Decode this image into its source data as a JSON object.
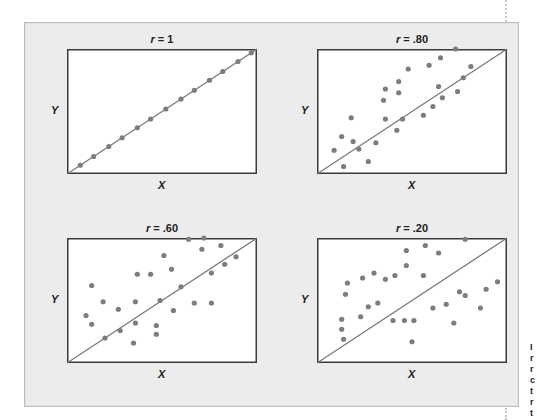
{
  "figure": {
    "side_text_fragment": [
      "I",
      "r",
      "r",
      "c",
      "t",
      "r",
      "t"
    ]
  },
  "chart_data": [
    {
      "type": "scatter",
      "title": "r = 1",
      "title_var": "r",
      "title_value": "= 1",
      "xlabel": "X",
      "ylabel": "Y",
      "grid": false,
      "trend_line": {
        "from": [
          0,
          0
        ],
        "to": [
          1,
          1
        ]
      },
      "xlim": [
        0,
        1
      ],
      "ylim": [
        0,
        1
      ],
      "points": [
        [
          0.07,
          0.07
        ],
        [
          0.14,
          0.14
        ],
        [
          0.22,
          0.22
        ],
        [
          0.29,
          0.29
        ],
        [
          0.37,
          0.37
        ],
        [
          0.44,
          0.44
        ],
        [
          0.52,
          0.52
        ],
        [
          0.6,
          0.6
        ],
        [
          0.67,
          0.67
        ],
        [
          0.75,
          0.75
        ],
        [
          0.82,
          0.82
        ],
        [
          0.9,
          0.9
        ],
        [
          0.97,
          0.97
        ]
      ]
    },
    {
      "type": "scatter",
      "title": "r = .80",
      "title_var": "r",
      "title_value": "= .80",
      "xlabel": "X",
      "ylabel": "Y",
      "grid": false,
      "trend_line": {
        "from": [
          0,
          0
        ],
        "to": [
          1,
          1
        ]
      },
      "xlim": [
        0,
        1
      ],
      "ylim": [
        0,
        1
      ],
      "points": [
        [
          0.09,
          0.19
        ],
        [
          0.13,
          0.3
        ],
        [
          0.14,
          0.06
        ],
        [
          0.18,
          0.45
        ],
        [
          0.19,
          0.26
        ],
        [
          0.22,
          0.2
        ],
        [
          0.27,
          0.1
        ],
        [
          0.31,
          0.25
        ],
        [
          0.35,
          0.59
        ],
        [
          0.36,
          0.44
        ],
        [
          0.36,
          0.68
        ],
        [
          0.42,
          0.35
        ],
        [
          0.43,
          0.74
        ],
        [
          0.43,
          0.65
        ],
        [
          0.45,
          0.44
        ],
        [
          0.48,
          0.84
        ],
        [
          0.56,
          0.47
        ],
        [
          0.59,
          0.87
        ],
        [
          0.61,
          0.54
        ],
        [
          0.64,
          0.7
        ],
        [
          0.65,
          0.93
        ],
        [
          0.66,
          0.61
        ],
        [
          0.73,
          1.0
        ],
        [
          0.74,
          0.66
        ],
        [
          0.77,
          0.77
        ],
        [
          0.81,
          0.86
        ]
      ]
    },
    {
      "type": "scatter",
      "title": "r = .60",
      "title_var": "r",
      "title_value": "= .60",
      "xlabel": "X",
      "ylabel": "Y",
      "grid": false,
      "trend_line": {
        "from": [
          0,
          0
        ],
        "to": [
          1,
          1
        ]
      },
      "xlim": [
        0,
        1
      ],
      "ylim": [
        0,
        1
      ],
      "points": [
        [
          0.1,
          0.38
        ],
        [
          0.13,
          0.62
        ],
        [
          0.13,
          0.31
        ],
        [
          0.19,
          0.49
        ],
        [
          0.2,
          0.2
        ],
        [
          0.27,
          0.43
        ],
        [
          0.28,
          0.26
        ],
        [
          0.35,
          0.16
        ],
        [
          0.36,
          0.32
        ],
        [
          0.36,
          0.49
        ],
        [
          0.37,
          0.71
        ],
        [
          0.44,
          0.71
        ],
        [
          0.47,
          0.23
        ],
        [
          0.47,
          0.3
        ],
        [
          0.49,
          0.5
        ],
        [
          0.51,
          0.86
        ],
        [
          0.55,
          0.75
        ],
        [
          0.56,
          0.42
        ],
        [
          0.6,
          0.61
        ],
        [
          0.64,
          0.99
        ],
        [
          0.67,
          0.48
        ],
        [
          0.71,
          0.91
        ],
        [
          0.72,
          1.0
        ],
        [
          0.76,
          0.72
        ],
        [
          0.76,
          0.48
        ],
        [
          0.81,
          0.94
        ],
        [
          0.83,
          0.79
        ],
        [
          0.89,
          0.85
        ]
      ]
    },
    {
      "type": "scatter",
      "title": "r = .20",
      "title_var": "r",
      "title_value": "= .20",
      "xlabel": "X",
      "ylabel": "Y",
      "grid": false,
      "trend_line": {
        "from": [
          0,
          0
        ],
        "to": [
          1,
          1
        ]
      },
      "xlim": [
        0,
        1
      ],
      "ylim": [
        0,
        1
      ],
      "points": [
        [
          0.13,
          0.27
        ],
        [
          0.13,
          0.35
        ],
        [
          0.14,
          0.19
        ],
        [
          0.15,
          0.55
        ],
        [
          0.16,
          0.64
        ],
        [
          0.23,
          0.37
        ],
        [
          0.24,
          0.68
        ],
        [
          0.27,
          0.45
        ],
        [
          0.3,
          0.72
        ],
        [
          0.32,
          0.48
        ],
        [
          0.36,
          0.67
        ],
        [
          0.4,
          0.34
        ],
        [
          0.41,
          0.7
        ],
        [
          0.46,
          0.34
        ],
        [
          0.47,
          0.78
        ],
        [
          0.47,
          0.9
        ],
        [
          0.5,
          0.17
        ],
        [
          0.51,
          0.34
        ],
        [
          0.56,
          0.7
        ],
        [
          0.57,
          0.94
        ],
        [
          0.61,
          0.44
        ],
        [
          0.64,
          0.88
        ],
        [
          0.68,
          0.47
        ],
        [
          0.72,
          0.32
        ],
        [
          0.75,
          0.57
        ],
        [
          0.78,
          0.54
        ],
        [
          0.78,
          0.99
        ],
        [
          0.86,
          0.44
        ],
        [
          0.89,
          0.59
        ],
        [
          0.95,
          0.65
        ]
      ]
    }
  ]
}
